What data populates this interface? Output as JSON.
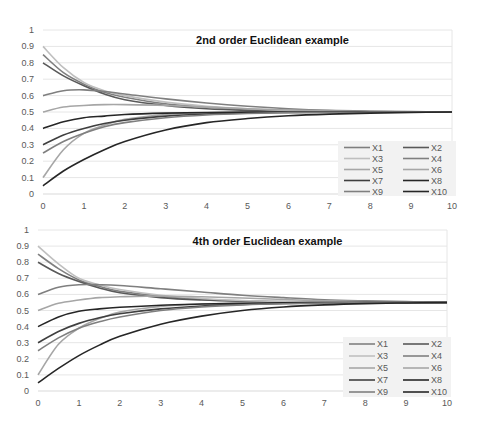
{
  "chart_data": [
    {
      "type": "line",
      "title": "2nd order Euclidean example",
      "xlabel": "",
      "ylabel": "",
      "xlim": [
        0,
        10
      ],
      "ylim": [
        0,
        1
      ],
      "xticks": [
        "0",
        "1",
        "2",
        "3",
        "4",
        "5",
        "6",
        "7",
        "8",
        "9",
        "10"
      ],
      "yticks": [
        "0",
        "0.1",
        "0.2",
        "0.3",
        "0.4",
        "0.5",
        "0.6",
        "0.7",
        "0.8",
        "0.9",
        "1"
      ],
      "grid": true,
      "legend_position": "bottom-right",
      "x": [
        0,
        0.5,
        1,
        1.5,
        2,
        3,
        4,
        5,
        6,
        7,
        8,
        9,
        10
      ],
      "series": [
        {
          "name": "X1",
          "color": "#7f7f7f",
          "values": [
            0.85,
            0.74,
            0.67,
            0.62,
            0.59,
            0.55,
            0.53,
            0.515,
            0.51,
            0.505,
            0.502,
            0.501,
            0.5
          ]
        },
        {
          "name": "X2",
          "color": "#595959",
          "values": [
            0.8,
            0.72,
            0.66,
            0.61,
            0.575,
            0.54,
            0.52,
            0.51,
            0.505,
            0.502,
            0.501,
            0.5,
            0.5
          ]
        },
        {
          "name": "X3",
          "color": "#bfbfbf",
          "values": [
            0.9,
            0.77,
            0.68,
            0.63,
            0.6,
            0.56,
            0.535,
            0.52,
            0.51,
            0.505,
            0.502,
            0.501,
            0.5
          ]
        },
        {
          "name": "X4",
          "color": "#7f7f7f",
          "values": [
            0.6,
            0.63,
            0.635,
            0.625,
            0.61,
            0.58,
            0.555,
            0.535,
            0.52,
            0.51,
            0.505,
            0.502,
            0.5
          ]
        },
        {
          "name": "X5",
          "color": "#a6a6a6",
          "values": [
            0.5,
            0.53,
            0.54,
            0.545,
            0.545,
            0.54,
            0.53,
            0.52,
            0.512,
            0.506,
            0.503,
            0.501,
            0.5
          ]
        },
        {
          "name": "X6",
          "color": "#a6a6a6",
          "values": [
            0.1,
            0.27,
            0.37,
            0.42,
            0.455,
            0.485,
            0.495,
            0.498,
            0.499,
            0.5,
            0.5,
            0.5,
            0.5
          ]
        },
        {
          "name": "X7",
          "color": "#3f3f3f",
          "values": [
            0.3,
            0.36,
            0.4,
            0.43,
            0.45,
            0.475,
            0.488,
            0.494,
            0.497,
            0.499,
            0.5,
            0.5,
            0.5
          ]
        },
        {
          "name": "X8",
          "color": "#262626",
          "values": [
            0.4,
            0.44,
            0.465,
            0.475,
            0.485,
            0.493,
            0.497,
            0.499,
            0.5,
            0.5,
            0.5,
            0.5,
            0.5
          ]
        },
        {
          "name": "X9",
          "color": "#7f7f7f",
          "values": [
            0.25,
            0.32,
            0.37,
            0.41,
            0.435,
            0.465,
            0.482,
            0.491,
            0.496,
            0.498,
            0.499,
            0.5,
            0.5
          ]
        },
        {
          "name": "X10",
          "color": "#262626",
          "values": [
            0.05,
            0.14,
            0.21,
            0.27,
            0.32,
            0.39,
            0.435,
            0.46,
            0.477,
            0.487,
            0.493,
            0.497,
            0.5
          ]
        }
      ]
    },
    {
      "type": "line",
      "title": "4th order Euclidean example",
      "xlabel": "",
      "ylabel": "",
      "xlim": [
        0,
        10
      ],
      "ylim": [
        0,
        1
      ],
      "xticks": [
        "0",
        "1",
        "2",
        "3",
        "4",
        "5",
        "6",
        "7",
        "8",
        "9",
        "10"
      ],
      "yticks": [
        "0",
        "0.1",
        "0.2",
        "0.3",
        "0.4",
        "0.5",
        "0.6",
        "0.7",
        "0.8",
        "0.9",
        "1"
      ],
      "grid": true,
      "legend_position": "bottom-right",
      "x": [
        0,
        0.5,
        1,
        1.5,
        2,
        3,
        4,
        5,
        6,
        7,
        8,
        9,
        10
      ],
      "series": [
        {
          "name": "X1",
          "color": "#7f7f7f",
          "values": [
            0.85,
            0.76,
            0.69,
            0.65,
            0.62,
            0.59,
            0.57,
            0.56,
            0.555,
            0.552,
            0.551,
            0.55,
            0.55
          ]
        },
        {
          "name": "X2",
          "color": "#595959",
          "values": [
            0.8,
            0.73,
            0.68,
            0.64,
            0.61,
            0.58,
            0.565,
            0.557,
            0.553,
            0.551,
            0.55,
            0.55,
            0.55
          ]
        },
        {
          "name": "X3",
          "color": "#bfbfbf",
          "values": [
            0.9,
            0.79,
            0.7,
            0.66,
            0.63,
            0.595,
            0.575,
            0.562,
            0.556,
            0.553,
            0.551,
            0.55,
            0.55
          ]
        },
        {
          "name": "X4",
          "color": "#7f7f7f",
          "values": [
            0.6,
            0.645,
            0.66,
            0.66,
            0.655,
            0.635,
            0.615,
            0.595,
            0.58,
            0.567,
            0.56,
            0.555,
            0.55
          ]
        },
        {
          "name": "X5",
          "color": "#a6a6a6",
          "values": [
            0.5,
            0.545,
            0.565,
            0.58,
            0.585,
            0.59,
            0.585,
            0.578,
            0.568,
            0.56,
            0.555,
            0.552,
            0.55
          ]
        },
        {
          "name": "X6",
          "color": "#a6a6a6",
          "values": [
            0.1,
            0.29,
            0.39,
            0.45,
            0.49,
            0.525,
            0.54,
            0.545,
            0.548,
            0.55,
            0.55,
            0.55,
            0.55
          ]
        },
        {
          "name": "X7",
          "color": "#3f3f3f",
          "values": [
            0.3,
            0.37,
            0.42,
            0.455,
            0.48,
            0.51,
            0.528,
            0.538,
            0.544,
            0.547,
            0.549,
            0.55,
            0.55
          ]
        },
        {
          "name": "X8",
          "color": "#262626",
          "values": [
            0.4,
            0.46,
            0.495,
            0.51,
            0.52,
            0.533,
            0.54,
            0.545,
            0.548,
            0.549,
            0.55,
            0.55,
            0.55
          ]
        },
        {
          "name": "X9",
          "color": "#7f7f7f",
          "values": [
            0.25,
            0.33,
            0.39,
            0.43,
            0.46,
            0.5,
            0.522,
            0.535,
            0.542,
            0.546,
            0.548,
            0.55,
            0.55
          ]
        },
        {
          "name": "X10",
          "color": "#262626",
          "values": [
            0.05,
            0.14,
            0.22,
            0.285,
            0.34,
            0.415,
            0.465,
            0.5,
            0.522,
            0.535,
            0.543,
            0.547,
            0.55
          ]
        }
      ]
    }
  ]
}
